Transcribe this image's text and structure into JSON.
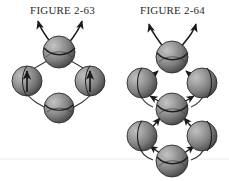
{
  "page": {
    "background_color": "#ffffff",
    "width": 229,
    "height": 181
  },
  "figures": [
    {
      "id": "figure-2-63",
      "caption": "FIGURE 2-63",
      "description": "Four shaded spheres arranged in a diamond with curved connecting arcs; two curved arrows exit upward from the top sphere and the two side spheres each contain an upward arrow.",
      "sphere_count": 4,
      "spheres": [
        {
          "name": "top-sphere",
          "cx": 59,
          "cy": 52,
          "r": 16,
          "marking": "equator-arc",
          "inner_arrow": "none"
        },
        {
          "name": "left-sphere",
          "cx": 27,
          "cy": 81,
          "r": 15,
          "marking": "meridian",
          "inner_arrow": "up"
        },
        {
          "name": "right-sphere",
          "cx": 90,
          "cy": 81,
          "r": 15,
          "marking": "meridian",
          "inner_arrow": "up"
        },
        {
          "name": "bottom-sphere",
          "cx": 59,
          "cy": 108,
          "r": 15,
          "marking": "equator-arc",
          "inner_arrow": "none"
        }
      ],
      "escape_arrows": 2
    },
    {
      "id": "figure-2-64",
      "caption": "FIGURE 2-64",
      "description": "Seven shaded spheres forming two stacked diamond rings joined at a shared middle sphere; arrowheads point along the ring paths and two curved arrows exit upward from the top sphere.",
      "sphere_count": 7,
      "spheres": [
        {
          "name": "top-sphere",
          "cx": 172,
          "cy": 57,
          "r": 16,
          "marking": "equator-arc",
          "inner_arrow": "none"
        },
        {
          "name": "upper-left-sphere",
          "cx": 142,
          "cy": 83,
          "r": 15,
          "marking": "meridian",
          "inner_arrow": "none"
        },
        {
          "name": "upper-right-sphere",
          "cx": 202,
          "cy": 83,
          "r": 15,
          "marking": "meridian",
          "inner_arrow": "none"
        },
        {
          "name": "middle-sphere",
          "cx": 172,
          "cy": 109,
          "r": 16,
          "marking": "equator-arc",
          "inner_arrow": "none"
        },
        {
          "name": "lower-left-sphere",
          "cx": 142,
          "cy": 136,
          "r": 15,
          "marking": "meridian",
          "inner_arrow": "none"
        },
        {
          "name": "lower-right-sphere",
          "cx": 202,
          "cy": 136,
          "r": 15,
          "marking": "meridian",
          "inner_arrow": "none"
        },
        {
          "name": "bottom-sphere",
          "cx": 172,
          "cy": 161,
          "r": 16,
          "marking": "equator-arc",
          "inner_arrow": "none"
        }
      ],
      "escape_arrows": 2
    }
  ],
  "style": {
    "sphere_light": "#b9b9b9",
    "sphere_mid": "#8d8d8d",
    "sphere_dark": "#4a4a4a",
    "sphere_edge": "#2e2e2e",
    "arrow_color": "#1a1a1a",
    "arc_color": "#3a3a3a",
    "caption_color": "#2b2b2b",
    "baseline_color": "#f2f3f6"
  },
  "baseline": {
    "name": "faint-horizontal-rule",
    "y": 159,
    "visible": true
  }
}
